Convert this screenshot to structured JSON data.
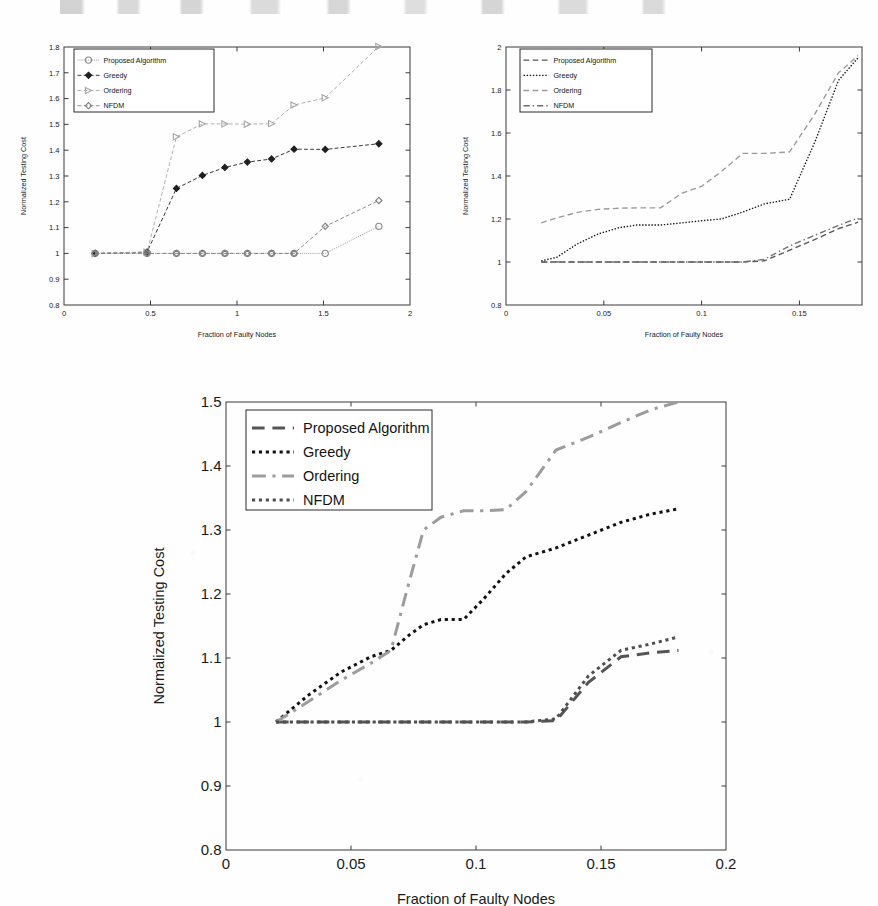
{
  "page": {
    "background_color": "#fefefe",
    "top_text_fragment": ""
  },
  "figures": [
    {
      "id": "fig-top-left",
      "name": "chart-top-left"
    },
    {
      "id": "fig-top-right",
      "name": "chart-top-right"
    },
    {
      "id": "fig-bottom",
      "name": "chart-bottom"
    }
  ],
  "chart_data": [
    {
      "id": "top-left",
      "type": "line",
      "title": "",
      "xlabel": "Fraction of Faulty Nodes",
      "ylabel": "Normalized Testing Cost",
      "xlim": [
        0,
        2
      ],
      "ylim": [
        0.8,
        1.8
      ],
      "xticks": [
        0,
        0.5,
        1,
        1.5,
        2
      ],
      "xticklabels": [
        "0",
        "0.5",
        "1",
        "1.5",
        "2"
      ],
      "yticks": [
        0.8,
        0.9,
        1.0,
        1.1,
        1.2,
        1.3,
        1.4,
        1.5,
        1.6,
        1.7,
        1.8
      ],
      "yticklabels": [
        "0.8",
        "0.9",
        "1",
        "1.1",
        "1.2",
        "1.3",
        "1.4",
        "1.5",
        "1.6",
        "1.7",
        "1.8"
      ],
      "grid": false,
      "legend_position": "upper-left",
      "x": [
        0.18,
        0.48,
        0.65,
        0.8,
        0.93,
        1.06,
        1.2,
        1.33,
        1.51,
        1.82
      ],
      "series": [
        {
          "name": "Proposed Algorithm",
          "marker": "circle",
          "linestyle": "dotted",
          "color": "#8a8a8a",
          "values": [
            1.0,
            1.0,
            1.0,
            1.0,
            1.0,
            1.0,
            1.0,
            1.0,
            1.0,
            1.105
          ]
        },
        {
          "name": "Greedy",
          "marker": "diamond-filled",
          "linestyle": "dashed",
          "color": "#1f1f1f",
          "values": [
            1.0,
            1.005,
            1.252,
            1.302,
            1.333,
            1.354,
            1.366,
            1.404,
            1.403,
            1.425
          ]
        },
        {
          "name": "Ordering",
          "marker": "triangle-right",
          "linestyle": "dashed",
          "color": "#a6a6a6",
          "values": [
            1.0,
            1.005,
            1.452,
            1.502,
            1.502,
            1.501,
            1.503,
            1.575,
            1.603,
            1.802
          ]
        },
        {
          "name": "NFDM",
          "marker": "diamond",
          "linestyle": "dashed",
          "color": "#7d7d7d",
          "values": [
            1.0,
            1.0,
            1.0,
            1.0,
            1.0,
            1.0,
            1.0,
            1.0,
            1.105,
            1.205
          ]
        }
      ]
    },
    {
      "id": "top-right",
      "type": "line",
      "title": "",
      "xlabel": "Fraction of Faulty Nodes",
      "ylabel": "Normalized Testing Cost",
      "xlim": [
        0,
        0.182
      ],
      "ylim": [
        0.8,
        2.0
      ],
      "xticks": [
        0,
        0.05,
        0.1,
        0.15
      ],
      "xticklabels": [
        "0",
        "0.05",
        "0.1",
        "0.15"
      ],
      "yticks": [
        0.8,
        1.0,
        1.2,
        1.4,
        1.6,
        1.8,
        2.0
      ],
      "yticklabels": [
        "0.8",
        "1",
        "1.2",
        "1.4",
        "1.6",
        "1.8",
        "2"
      ],
      "grid": false,
      "legend_position": "upper-left",
      "x": [
        0.018,
        0.026,
        0.036,
        0.047,
        0.058,
        0.067,
        0.079,
        0.09,
        0.1,
        0.11,
        0.121,
        0.132,
        0.145,
        0.158,
        0.17,
        0.18
      ],
      "series": [
        {
          "name": "Proposed Algorithm",
          "linestyle": "dashed",
          "color": "#565656",
          "values": [
            1.0,
            1.0,
            1.0,
            1.0,
            1.0,
            1.0,
            1.0,
            1.0,
            1.0,
            1.0,
            1.0,
            1.005,
            1.055,
            1.105,
            1.155,
            1.185
          ]
        },
        {
          "name": "Greedy",
          "linestyle": "dotted",
          "color": "#151515",
          "values": [
            1.005,
            1.022,
            1.082,
            1.13,
            1.16,
            1.172,
            1.172,
            1.182,
            1.192,
            1.2,
            1.232,
            1.27,
            1.292,
            1.56,
            1.845,
            1.95
          ]
        },
        {
          "name": "Ordering",
          "linestyle": "dashed",
          "color": "#9a9a9a",
          "values": [
            1.182,
            1.205,
            1.23,
            1.245,
            1.25,
            1.252,
            1.252,
            1.32,
            1.352,
            1.42,
            1.505,
            1.505,
            1.512,
            1.69,
            1.88,
            1.96
          ]
        },
        {
          "name": "NFDM",
          "linestyle": "dashdot",
          "color": "#6d6d6d",
          "values": [
            1.0,
            1.0,
            1.0,
            1.0,
            1.0,
            1.0,
            1.0,
            1.0,
            1.0,
            1.0,
            1.0,
            1.012,
            1.075,
            1.125,
            1.17,
            1.205
          ]
        }
      ]
    },
    {
      "id": "bottom",
      "type": "line",
      "title": "",
      "xlabel": "Fraction of Faulty Nodes",
      "ylabel": "Normalized Testing Cost",
      "xlim": [
        0,
        0.2
      ],
      "ylim": [
        0.8,
        1.5
      ],
      "xticks": [
        0,
        0.05,
        0.1,
        0.15,
        0.2
      ],
      "xticklabels": [
        "0",
        "0.05",
        "0.1",
        "0.15",
        "0.2"
      ],
      "yticks": [
        0.8,
        0.9,
        1.0,
        1.1,
        1.2,
        1.3,
        1.4,
        1.5
      ],
      "yticklabels": [
        "0.8",
        "0.9",
        "1",
        "1.1",
        "1.2",
        "1.3",
        "1.4",
        "1.5"
      ],
      "grid": false,
      "legend_position": "upper-left",
      "x": [
        0.02,
        0.033,
        0.046,
        0.058,
        0.066,
        0.073,
        0.079,
        0.086,
        0.095,
        0.103,
        0.112,
        0.12,
        0.132,
        0.145,
        0.158,
        0.17,
        0.181
      ],
      "series": [
        {
          "name": "Proposed Algorithm",
          "linestyle": "dashed",
          "color": "#555555",
          "values": [
            1.0,
            1.0,
            1.0,
            1.0,
            1.0,
            1.0,
            1.0,
            1.0,
            1.0,
            1.0,
            1.0,
            1.0,
            1.002,
            1.062,
            1.102,
            1.108,
            1.112
          ]
        },
        {
          "name": "Greedy",
          "linestyle": "dotted",
          "color": "#121212",
          "values": [
            1.0,
            1.042,
            1.078,
            1.102,
            1.112,
            1.135,
            1.152,
            1.16,
            1.16,
            1.192,
            1.232,
            1.258,
            1.272,
            1.292,
            1.312,
            1.325,
            1.333
          ]
        },
        {
          "name": "Ordering",
          "linestyle": "dashdot",
          "color": "#9c9c9c",
          "values": [
            1.0,
            1.032,
            1.065,
            1.092,
            1.112,
            1.215,
            1.3,
            1.32,
            1.33,
            1.33,
            1.332,
            1.36,
            1.425,
            1.445,
            1.468,
            1.488,
            1.5
          ]
        },
        {
          "name": "NFDM",
          "linestyle": "dotted",
          "color": "#4f4f4f",
          "values": [
            1.0,
            1.0,
            1.0,
            1.0,
            1.0,
            1.0,
            1.0,
            1.0,
            1.0,
            1.0,
            1.0,
            1.0,
            1.005,
            1.072,
            1.112,
            1.122,
            1.133
          ]
        }
      ]
    }
  ]
}
